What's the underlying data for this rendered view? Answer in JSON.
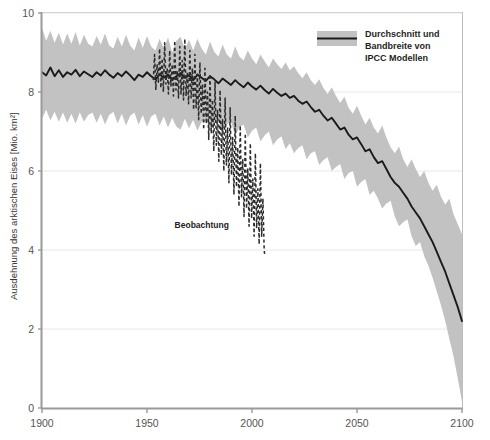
{
  "chart_data": {
    "type": "line",
    "title": "",
    "subtitle": "",
    "xlabel": "",
    "ylabel": "Ausdehnung des arktischen Eises [Mio. km²]",
    "xlim": [
      1900,
      2100
    ],
    "ylim": [
      0,
      10
    ],
    "xticks": [
      1900,
      1950,
      2000,
      2050,
      2100
    ],
    "yticks": [
      0,
      2,
      4,
      6,
      8,
      10
    ],
    "grid": "light horizontal gridlines at y ticks",
    "legend": {
      "position": "top-right inside plot",
      "entries": [
        {
          "label_lines": [
            "Durchschnitt und",
            "Bandbreite von",
            "IPCC Modellen"
          ],
          "swatch": "gray band with dark center line",
          "band_color": "#c2c2c2",
          "line_color": "#262626"
        }
      ]
    },
    "annotations": [
      {
        "text": "Beobachtung",
        "x": 1989,
        "y": 4.55,
        "target_series": "observation"
      }
    ],
    "series": [
      {
        "name": "IPCC Modelle – Durchschnitt",
        "role": "mean",
        "style": "solid",
        "color": "#1a1a1a",
        "x": [
          1900,
          1902,
          1904,
          1906,
          1908,
          1910,
          1912,
          1914,
          1916,
          1918,
          1920,
          1922,
          1924,
          1926,
          1928,
          1930,
          1932,
          1934,
          1936,
          1938,
          1940,
          1942,
          1944,
          1946,
          1948,
          1950,
          1952,
          1954,
          1956,
          1958,
          1960,
          1962,
          1964,
          1966,
          1968,
          1970,
          1972,
          1974,
          1976,
          1978,
          1980,
          1982,
          1984,
          1986,
          1988,
          1990,
          1992,
          1994,
          1996,
          1998,
          2000,
          2002,
          2004,
          2006,
          2008,
          2010,
          2012,
          2014,
          2016,
          2018,
          2020,
          2022,
          2024,
          2026,
          2028,
          2030,
          2032,
          2034,
          2036,
          2038,
          2040,
          2042,
          2044,
          2046,
          2048,
          2050,
          2052,
          2054,
          2056,
          2058,
          2060,
          2062,
          2064,
          2066,
          2068,
          2070,
          2072,
          2074,
          2076,
          2078,
          2080,
          2082,
          2084,
          2086,
          2088,
          2090,
          2092,
          2094,
          2096,
          2098,
          2100
        ],
        "y": [
          8.5,
          8.42,
          8.62,
          8.4,
          8.55,
          8.38,
          8.5,
          8.44,
          8.56,
          8.4,
          8.52,
          8.45,
          8.38,
          8.5,
          8.42,
          8.55,
          8.44,
          8.36,
          8.48,
          8.4,
          8.52,
          8.42,
          8.3,
          8.44,
          8.38,
          8.5,
          8.4,
          8.32,
          8.45,
          8.36,
          8.44,
          8.3,
          8.4,
          8.48,
          8.36,
          8.42,
          8.3,
          8.44,
          8.36,
          8.28,
          8.4,
          8.32,
          8.22,
          8.34,
          8.26,
          8.18,
          8.3,
          8.2,
          8.12,
          8.24,
          8.14,
          8.06,
          8.16,
          8.05,
          7.96,
          8.08,
          7.98,
          7.9,
          7.96,
          7.85,
          7.9,
          7.78,
          7.7,
          7.76,
          7.62,
          7.5,
          7.55,
          7.4,
          7.28,
          7.35,
          7.2,
          7.05,
          7.1,
          6.92,
          6.8,
          6.85,
          6.68,
          6.5,
          6.55,
          6.35,
          6.2,
          6.25,
          6.05,
          5.85,
          5.7,
          5.6,
          5.45,
          5.3,
          5.1,
          4.95,
          4.8,
          4.6,
          4.4,
          4.2,
          3.95,
          3.7,
          3.45,
          3.15,
          2.85,
          2.55,
          2.2
        ]
      },
      {
        "name": "IPCC Modelle – Bandbreite (oben)",
        "role": "band_upper",
        "style": "band",
        "color": "#c2c2c2",
        "x": [
          1900,
          1902,
          1904,
          1906,
          1908,
          1910,
          1912,
          1914,
          1916,
          1918,
          1920,
          1922,
          1924,
          1926,
          1928,
          1930,
          1932,
          1934,
          1936,
          1938,
          1940,
          1942,
          1944,
          1946,
          1948,
          1950,
          1952,
          1954,
          1956,
          1958,
          1960,
          1962,
          1964,
          1966,
          1968,
          1970,
          1972,
          1974,
          1976,
          1978,
          1980,
          1982,
          1984,
          1986,
          1988,
          1990,
          1992,
          1994,
          1996,
          1998,
          2000,
          2002,
          2004,
          2006,
          2008,
          2010,
          2012,
          2014,
          2016,
          2018,
          2020,
          2022,
          2024,
          2026,
          2028,
          2030,
          2032,
          2034,
          2036,
          2038,
          2040,
          2042,
          2044,
          2046,
          2048,
          2050,
          2052,
          2054,
          2056,
          2058,
          2060,
          2062,
          2064,
          2066,
          2068,
          2070,
          2072,
          2074,
          2076,
          2078,
          2080,
          2082,
          2084,
          2086,
          2088,
          2090,
          2092,
          2094,
          2096,
          2098,
          2100
        ],
        "y": [
          9.62,
          9.3,
          9.55,
          9.25,
          9.5,
          9.2,
          9.48,
          9.22,
          9.52,
          9.18,
          9.45,
          9.22,
          9.15,
          9.42,
          9.2,
          9.48,
          9.18,
          9.1,
          9.4,
          9.15,
          9.45,
          9.18,
          9.05,
          9.38,
          9.12,
          9.42,
          9.15,
          9.05,
          9.35,
          9.1,
          9.38,
          9.0,
          9.3,
          9.4,
          9.08,
          9.32,
          9.05,
          9.35,
          9.1,
          8.95,
          9.28,
          9.02,
          8.9,
          9.2,
          8.95,
          8.85,
          9.15,
          8.9,
          8.8,
          9.05,
          8.85,
          8.7,
          8.95,
          8.78,
          8.62,
          8.85,
          8.7,
          8.58,
          8.75,
          8.55,
          8.65,
          8.48,
          8.35,
          8.5,
          8.3,
          8.18,
          8.32,
          8.1,
          7.95,
          8.12,
          7.9,
          7.72,
          7.88,
          7.6,
          7.45,
          7.65,
          7.4,
          7.18,
          7.35,
          7.1,
          6.95,
          7.15,
          6.85,
          6.6,
          6.45,
          6.62,
          6.3,
          6.1,
          6.3,
          6.05,
          5.85,
          6.0,
          5.7,
          5.5,
          5.65,
          5.35,
          5.15,
          5.3,
          4.9,
          4.65,
          4.4
        ]
      },
      {
        "name": "IPCC Modelle – Bandbreite (unten)",
        "role": "band_lower",
        "style": "band",
        "color": "#c2c2c2",
        "x": [
          1900,
          1902,
          1904,
          1906,
          1908,
          1910,
          1912,
          1914,
          1916,
          1918,
          1920,
          1922,
          1924,
          1926,
          1928,
          1930,
          1932,
          1934,
          1936,
          1938,
          1940,
          1942,
          1944,
          1946,
          1948,
          1950,
          1952,
          1954,
          1956,
          1958,
          1960,
          1962,
          1964,
          1966,
          1968,
          1970,
          1972,
          1974,
          1976,
          1978,
          1980,
          1982,
          1984,
          1986,
          1988,
          1990,
          1992,
          1994,
          1996,
          1998,
          2000,
          2002,
          2004,
          2006,
          2008,
          2010,
          2012,
          2014,
          2016,
          2018,
          2020,
          2022,
          2024,
          2026,
          2028,
          2030,
          2032,
          2034,
          2036,
          2038,
          2040,
          2042,
          2044,
          2046,
          2048,
          2050,
          2052,
          2054,
          2056,
          2058,
          2060,
          2062,
          2064,
          2066,
          2068,
          2070,
          2072,
          2074,
          2076,
          2078,
          2080,
          2082,
          2084,
          2086,
          2088,
          2090,
          2092,
          2094,
          2096,
          2098,
          2100
        ],
        "y": [
          7.32,
          7.55,
          7.28,
          7.5,
          7.25,
          7.48,
          7.22,
          7.45,
          7.2,
          7.48,
          7.25,
          7.42,
          7.48,
          7.22,
          7.45,
          7.18,
          7.42,
          7.5,
          7.2,
          7.45,
          7.15,
          7.4,
          7.48,
          7.18,
          7.42,
          7.12,
          7.38,
          7.45,
          7.15,
          7.38,
          7.1,
          7.35,
          7.12,
          7.05,
          7.32,
          7.08,
          7.3,
          7.02,
          7.25,
          7.35,
          7.0,
          7.22,
          7.3,
          6.95,
          7.18,
          7.25,
          6.9,
          7.1,
          7.18,
          6.85,
          7.02,
          7.1,
          6.75,
          6.9,
          7.0,
          6.65,
          6.8,
          6.88,
          6.55,
          6.7,
          6.45,
          6.58,
          6.65,
          6.3,
          6.45,
          6.5,
          6.15,
          6.28,
          6.35,
          6.0,
          6.1,
          6.18,
          5.8,
          5.95,
          6.0,
          5.6,
          5.72,
          5.8,
          5.4,
          5.5,
          5.3,
          5.05,
          5.18,
          5.25,
          4.85,
          4.6,
          4.7,
          4.78,
          4.35,
          4.1,
          4.2,
          3.85,
          3.6,
          3.3,
          2.95,
          2.6,
          2.2,
          1.75,
          1.3,
          0.75,
          0.15
        ]
      },
      {
        "name": "Beobachtung",
        "role": "observation",
        "style": "dashed",
        "color": "#2b2b2b",
        "x": [
          1953,
          1953.6,
          1954.2,
          1954.8,
          1955.4,
          1956,
          1956.6,
          1957.2,
          1957.8,
          1958.4,
          1959,
          1959.6,
          1960.2,
          1960.8,
          1961.4,
          1962,
          1962.6,
          1963.2,
          1963.8,
          1964.4,
          1965,
          1965.6,
          1966.2,
          1966.8,
          1967.4,
          1968,
          1968.6,
          1969.2,
          1969.8,
          1970.4,
          1971,
          1971.6,
          1972.2,
          1972.8,
          1973.4,
          1974,
          1974.6,
          1975.2,
          1975.8,
          1976.4,
          1977,
          1977.6,
          1978.2,
          1978.8,
          1979.4,
          1980,
          1980.6,
          1981.2,
          1981.8,
          1982.4,
          1983,
          1983.6,
          1984.2,
          1984.8,
          1985.4,
          1986,
          1986.6,
          1987.2,
          1987.8,
          1988.4,
          1989,
          1989.6,
          1990.2,
          1990.8,
          1991.4,
          1992,
          1992.6,
          1993.2,
          1993.8,
          1994.4,
          1995,
          1995.6,
          1996.2,
          1996.8,
          1997.4,
          1998,
          1998.6,
          1999.2,
          1999.8,
          2000.4,
          2001,
          2001.6,
          2002.2,
          2002.8,
          2003.4,
          2004,
          2004.6,
          2005.2,
          2005.8,
          2006
        ],
        "y": [
          8.3,
          8.95,
          8.05,
          8.7,
          8.25,
          9.1,
          8.1,
          8.85,
          8.0,
          9.25,
          8.2,
          8.6,
          7.95,
          9.05,
          8.15,
          8.7,
          7.9,
          9.3,
          8.05,
          8.55,
          7.85,
          9.15,
          7.95,
          8.8,
          7.8,
          9.35,
          7.9,
          8.5,
          7.7,
          9.05,
          7.85,
          8.6,
          7.55,
          8.95,
          7.6,
          8.45,
          7.3,
          8.75,
          7.45,
          8.2,
          7.05,
          8.6,
          7.2,
          8.0,
          6.8,
          8.45,
          6.95,
          7.8,
          6.5,
          8.25,
          6.65,
          7.55,
          6.25,
          8.05,
          6.4,
          7.3,
          6.0,
          7.85,
          6.15,
          7.1,
          5.7,
          7.6,
          5.9,
          6.85,
          5.4,
          7.4,
          5.6,
          6.6,
          5.1,
          7.15,
          5.35,
          6.3,
          4.85,
          6.95,
          5.05,
          6.05,
          4.6,
          6.7,
          4.8,
          5.8,
          4.35,
          6.45,
          4.55,
          5.55,
          4.15,
          6.2,
          4.35,
          5.3,
          4.0,
          3.9
        ]
      }
    ]
  },
  "axes": {
    "y_title": "Ausdehnung des arktischen Eises [Mio. km²]",
    "y_tick_labels": [
      "10",
      "8",
      "6",
      "4",
      "2",
      "0"
    ],
    "x_tick_labels": [
      "1900",
      "1950",
      "2000",
      "2050",
      "2100"
    ]
  },
  "legend": {
    "line1": "Durchschnitt und",
    "line2": "Bandbreite von",
    "line3": "IPCC Modellen"
  },
  "annotations": {
    "observation_label": "Beobachtung"
  },
  "colors": {
    "band": "#c2c2c2",
    "mean_line": "#1a1a1a",
    "observation_line": "#2b2b2b",
    "grid": "#e8e8e8",
    "axis": "#9a9a9a",
    "tick_text": "#555555",
    "background": "#ffffff"
  }
}
